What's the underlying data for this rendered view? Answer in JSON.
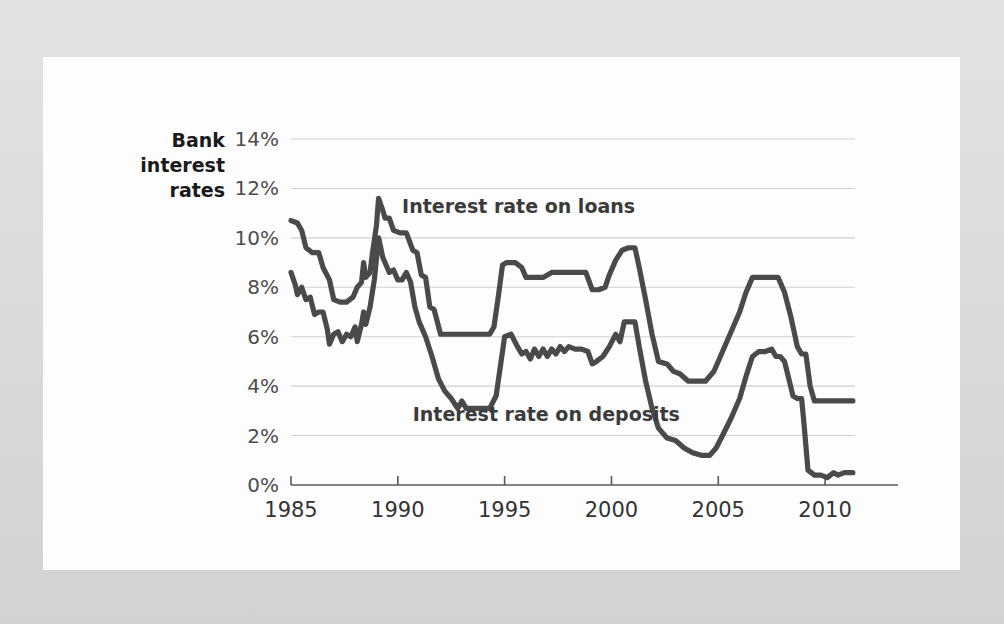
{
  "figure": {
    "background_color": "#d9d9d9",
    "card_color": "#fdfdfd",
    "axis_title_line1": "Bank",
    "axis_title_line2": "interest",
    "axis_title_line3": "rates"
  },
  "chart_data": {
    "type": "line",
    "title": "",
    "subtitle": "",
    "xlabel": "",
    "ylabel": "Bank interest rates",
    "xlim": [
      1985,
      2011.4
    ],
    "ylim": [
      0,
      14
    ],
    "grid": true,
    "legend_position": "inline-annotation",
    "series_color": "#4a4a4a",
    "x_ticks": [
      "1985",
      "1990",
      "1995",
      "2000",
      "2005",
      "2010"
    ],
    "x_tick_values": [
      1985,
      1990,
      1995,
      2000,
      2005,
      2010
    ],
    "y_ticks": [
      "0%",
      "2%",
      "4%",
      "6%",
      "8%",
      "10%",
      "12%",
      "14%"
    ],
    "y_tick_values": [
      0,
      2,
      4,
      6,
      8,
      10,
      12,
      14
    ],
    "annotations": [
      {
        "text": "Interest rate on loans",
        "x": 1990.2,
        "y": 11.0
      },
      {
        "text": "Interest rate on deposits",
        "x": 1990.7,
        "y": 2.6
      }
    ],
    "series": [
      {
        "name": "Interest rate on loans",
        "points": [
          [
            1985.0,
            10.7
          ],
          [
            1985.3,
            10.6
          ],
          [
            1985.5,
            10.3
          ],
          [
            1985.7,
            9.6
          ],
          [
            1986.0,
            9.4
          ],
          [
            1986.3,
            9.4
          ],
          [
            1986.5,
            8.8
          ],
          [
            1986.8,
            8.3
          ],
          [
            1987.0,
            7.5
          ],
          [
            1987.3,
            7.4
          ],
          [
            1987.6,
            7.4
          ],
          [
            1987.9,
            7.6
          ],
          [
            1988.1,
            8.0
          ],
          [
            1988.3,
            8.2
          ],
          [
            1988.4,
            9.0
          ],
          [
            1988.5,
            8.4
          ],
          [
            1988.7,
            8.6
          ],
          [
            1988.8,
            9.3
          ],
          [
            1989.0,
            10.5
          ],
          [
            1989.1,
            11.6
          ],
          [
            1989.3,
            11.1
          ],
          [
            1989.4,
            10.8
          ],
          [
            1989.6,
            10.8
          ],
          [
            1989.8,
            10.3
          ],
          [
            1990.1,
            10.2
          ],
          [
            1990.4,
            10.2
          ],
          [
            1990.7,
            9.5
          ],
          [
            1990.9,
            9.4
          ],
          [
            1991.1,
            8.5
          ],
          [
            1991.3,
            8.4
          ],
          [
            1991.5,
            7.2
          ],
          [
            1991.7,
            7.1
          ],
          [
            1992.0,
            6.1
          ],
          [
            1992.5,
            6.1
          ],
          [
            1993.0,
            6.1
          ],
          [
            1993.5,
            6.1
          ],
          [
            1994.0,
            6.1
          ],
          [
            1994.3,
            6.1
          ],
          [
            1994.5,
            6.4
          ],
          [
            1994.7,
            7.6
          ],
          [
            1994.9,
            8.9
          ],
          [
            1995.1,
            9.0
          ],
          [
            1995.5,
            9.0
          ],
          [
            1995.8,
            8.8
          ],
          [
            1996.0,
            8.4
          ],
          [
            1996.4,
            8.4
          ],
          [
            1996.8,
            8.4
          ],
          [
            1997.2,
            8.6
          ],
          [
            1997.6,
            8.6
          ],
          [
            1998.0,
            8.6
          ],
          [
            1998.4,
            8.6
          ],
          [
            1998.8,
            8.6
          ],
          [
            1999.1,
            7.9
          ],
          [
            1999.4,
            7.9
          ],
          [
            1999.7,
            8.0
          ],
          [
            1999.9,
            8.5
          ],
          [
            2000.2,
            9.1
          ],
          [
            2000.5,
            9.5
          ],
          [
            2000.8,
            9.6
          ],
          [
            2001.1,
            9.6
          ],
          [
            2001.3,
            8.8
          ],
          [
            2001.6,
            7.5
          ],
          [
            2001.9,
            6.1
          ],
          [
            2002.2,
            5.0
          ],
          [
            2002.6,
            4.9
          ],
          [
            2002.9,
            4.6
          ],
          [
            2003.2,
            4.5
          ],
          [
            2003.6,
            4.2
          ],
          [
            2004.0,
            4.2
          ],
          [
            2004.4,
            4.2
          ],
          [
            2004.8,
            4.6
          ],
          [
            2005.2,
            5.4
          ],
          [
            2005.6,
            6.2
          ],
          [
            2006.0,
            7.0
          ],
          [
            2006.3,
            7.8
          ],
          [
            2006.6,
            8.4
          ],
          [
            2007.0,
            8.4
          ],
          [
            2007.4,
            8.4
          ],
          [
            2007.8,
            8.4
          ],
          [
            2008.1,
            7.8
          ],
          [
            2008.4,
            6.8
          ],
          [
            2008.7,
            5.6
          ],
          [
            2008.9,
            5.3
          ],
          [
            2009.1,
            5.3
          ],
          [
            2009.3,
            4.0
          ],
          [
            2009.5,
            3.4
          ],
          [
            2009.8,
            3.4
          ],
          [
            2010.2,
            3.4
          ],
          [
            2010.6,
            3.4
          ],
          [
            2011.0,
            3.4
          ],
          [
            2011.3,
            3.4
          ]
        ]
      },
      {
        "name": "Interest rate on deposits",
        "points": [
          [
            1985.0,
            8.6
          ],
          [
            1985.2,
            8.1
          ],
          [
            1985.3,
            7.7
          ],
          [
            1985.5,
            8.0
          ],
          [
            1985.7,
            7.5
          ],
          [
            1985.9,
            7.6
          ],
          [
            1986.1,
            6.9
          ],
          [
            1986.3,
            7.0
          ],
          [
            1986.5,
            7.0
          ],
          [
            1986.7,
            6.3
          ],
          [
            1986.8,
            5.7
          ],
          [
            1987.0,
            6.1
          ],
          [
            1987.2,
            6.2
          ],
          [
            1987.4,
            5.8
          ],
          [
            1987.6,
            6.1
          ],
          [
            1987.8,
            6.0
          ],
          [
            1988.0,
            6.4
          ],
          [
            1988.1,
            5.8
          ],
          [
            1988.3,
            6.5
          ],
          [
            1988.4,
            7.0
          ],
          [
            1988.5,
            6.5
          ],
          [
            1988.7,
            7.2
          ],
          [
            1988.9,
            8.3
          ],
          [
            1989.1,
            10.0
          ],
          [
            1989.3,
            9.2
          ],
          [
            1989.4,
            9.0
          ],
          [
            1989.6,
            8.6
          ],
          [
            1989.8,
            8.7
          ],
          [
            1990.0,
            8.3
          ],
          [
            1990.2,
            8.3
          ],
          [
            1990.4,
            8.6
          ],
          [
            1990.6,
            8.2
          ],
          [
            1990.8,
            7.2
          ],
          [
            1991.0,
            6.6
          ],
          [
            1991.3,
            6.0
          ],
          [
            1991.6,
            5.2
          ],
          [
            1991.9,
            4.3
          ],
          [
            1992.2,
            3.8
          ],
          [
            1992.5,
            3.5
          ],
          [
            1992.8,
            3.1
          ],
          [
            1993.0,
            3.4
          ],
          [
            1993.2,
            3.1
          ],
          [
            1993.5,
            3.1
          ],
          [
            1993.9,
            3.1
          ],
          [
            1994.3,
            3.1
          ],
          [
            1994.6,
            3.6
          ],
          [
            1994.8,
            4.8
          ],
          [
            1995.0,
            6.0
          ],
          [
            1995.3,
            6.1
          ],
          [
            1995.6,
            5.6
          ],
          [
            1995.8,
            5.3
          ],
          [
            1996.0,
            5.4
          ],
          [
            1996.2,
            5.1
          ],
          [
            1996.4,
            5.5
          ],
          [
            1996.6,
            5.2
          ],
          [
            1996.8,
            5.5
          ],
          [
            1997.0,
            5.2
          ],
          [
            1997.2,
            5.5
          ],
          [
            1997.4,
            5.3
          ],
          [
            1997.6,
            5.6
          ],
          [
            1997.8,
            5.4
          ],
          [
            1998.0,
            5.6
          ],
          [
            1998.3,
            5.5
          ],
          [
            1998.6,
            5.5
          ],
          [
            1998.9,
            5.4
          ],
          [
            1999.1,
            4.9
          ],
          [
            1999.3,
            5.0
          ],
          [
            1999.6,
            5.2
          ],
          [
            1999.9,
            5.6
          ],
          [
            2000.2,
            6.1
          ],
          [
            2000.4,
            5.8
          ],
          [
            2000.6,
            6.6
          ],
          [
            2000.9,
            6.6
          ],
          [
            2001.1,
            6.6
          ],
          [
            2001.3,
            5.6
          ],
          [
            2001.6,
            4.2
          ],
          [
            2001.9,
            3.1
          ],
          [
            2002.2,
            2.3
          ],
          [
            2002.6,
            1.9
          ],
          [
            2003.0,
            1.8
          ],
          [
            2003.4,
            1.5
          ],
          [
            2003.8,
            1.3
          ],
          [
            2004.2,
            1.2
          ],
          [
            2004.6,
            1.2
          ],
          [
            2004.9,
            1.5
          ],
          [
            2005.2,
            2.0
          ],
          [
            2005.6,
            2.7
          ],
          [
            2006.0,
            3.5
          ],
          [
            2006.3,
            4.4
          ],
          [
            2006.6,
            5.2
          ],
          [
            2006.9,
            5.4
          ],
          [
            2007.2,
            5.4
          ],
          [
            2007.5,
            5.5
          ],
          [
            2007.7,
            5.2
          ],
          [
            2007.9,
            5.2
          ],
          [
            2008.1,
            5.0
          ],
          [
            2008.3,
            4.3
          ],
          [
            2008.5,
            3.6
          ],
          [
            2008.7,
            3.5
          ],
          [
            2008.9,
            3.5
          ],
          [
            2009.0,
            2.6
          ],
          [
            2009.2,
            0.6
          ],
          [
            2009.5,
            0.4
          ],
          [
            2009.8,
            0.4
          ],
          [
            2010.1,
            0.3
          ],
          [
            2010.4,
            0.5
          ],
          [
            2010.6,
            0.4
          ],
          [
            2010.9,
            0.5
          ],
          [
            2011.1,
            0.5
          ],
          [
            2011.3,
            0.5
          ]
        ]
      }
    ]
  }
}
